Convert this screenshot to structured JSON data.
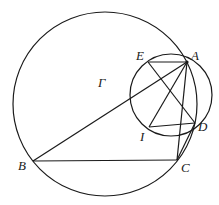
{
  "diagram": {
    "type": "geometry",
    "points": {
      "A": {
        "label": "A",
        "x": 187,
        "y": 62,
        "lx": 191,
        "ly": 60
      },
      "B": {
        "label": "B",
        "x": 33,
        "y": 161,
        "lx": 18,
        "ly": 170
      },
      "C": {
        "label": "C",
        "x": 177,
        "y": 160,
        "lx": 181,
        "ly": 172
      },
      "D": {
        "label": "D",
        "x": 195,
        "y": 123,
        "lx": 198,
        "ly": 131
      },
      "E": {
        "label": "E",
        "x": 148,
        "y": 62,
        "lx": 136,
        "ly": 60
      },
      "I": {
        "label": "I",
        "x": 149,
        "y": 127,
        "lx": 139,
        "ly": 141
      }
    },
    "circles": [
      {
        "name": "Gamma",
        "label": "Γ",
        "cx": 105,
        "cy": 104,
        "r": 92,
        "lx": 98,
        "ly": 87
      },
      {
        "name": "small-circle",
        "cx": 171,
        "cy": 95,
        "r": 41
      }
    ],
    "segments": [
      [
        "A",
        "E"
      ],
      [
        "A",
        "B"
      ],
      [
        "A",
        "I"
      ],
      [
        "A",
        "C"
      ],
      [
        "B",
        "C"
      ],
      [
        "E",
        "D"
      ],
      [
        "I",
        "D"
      ],
      [
        "D",
        "C"
      ]
    ]
  }
}
